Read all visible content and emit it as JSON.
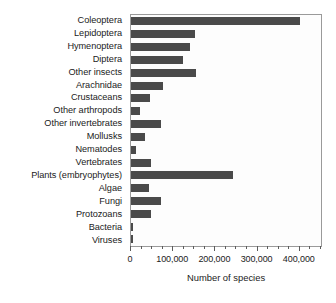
{
  "chart_data": {
    "type": "bar",
    "orientation": "horizontal",
    "title": "",
    "xlabel": "Number of species",
    "ylabel": "",
    "xlim": [
      0,
      455000
    ],
    "xticks": [
      0,
      100000,
      200000,
      300000,
      400000
    ],
    "xticklabels": [
      "0",
      "100,000",
      "200,000",
      "300,000",
      "400,000"
    ],
    "minor_tick_interval": 25000,
    "grid": false,
    "legend": null,
    "bar_color": "#4a4a4a",
    "frame_color": "#9a9a9a",
    "plot_background": "#fdfdfd",
    "categories": [
      "Coleoptera",
      "Lepidoptera",
      "Hymenoptera",
      "Diptera",
      "Other insects",
      "Arachnidae",
      "Crustaceans",
      "Other arthropods",
      "Other invertebrates",
      "Mollusks",
      "Nematodes",
      "Vertebrates",
      "Plants (embryophytes)",
      "Algae",
      "Fungi",
      "Protozoans",
      "Bacteria",
      "Viruses"
    ],
    "values": [
      400000,
      152000,
      140000,
      124000,
      155000,
      75000,
      44000,
      21000,
      71000,
      33000,
      12000,
      48000,
      241000,
      43000,
      72000,
      47000,
      4500,
      5000
    ]
  }
}
